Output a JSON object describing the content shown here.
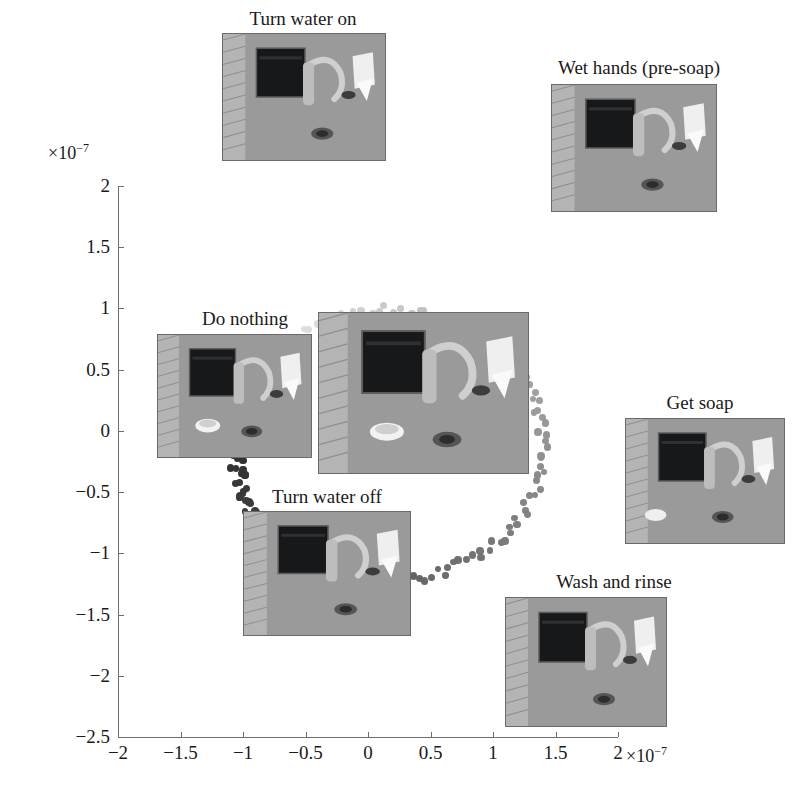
{
  "figure": {
    "type": "scatter-embedding",
    "background": "#ffffff"
  },
  "axes": {
    "x": {
      "label": "",
      "exponent_prefix": "×",
      "exponent_base": "10",
      "exponent_power": "−7",
      "ticks": [
        "−2",
        "−1.5",
        "−1",
        "−0.5",
        "0",
        "0.5",
        "1",
        "1.5",
        "2"
      ],
      "tick_values": [
        -2,
        -1.5,
        -1,
        -0.5,
        0,
        0.5,
        1,
        1.5,
        2
      ],
      "range": [
        -2,
        2
      ],
      "scale_factor": "1e-7"
    },
    "y": {
      "label": "",
      "exponent_prefix": "×",
      "exponent_base": "10",
      "exponent_power": "−7",
      "ticks": [
        "2",
        "1.5",
        "1",
        "0.5",
        "0",
        "−0.5",
        "−1",
        "−1.5",
        "−2",
        "−2.5"
      ],
      "tick_values": [
        2,
        1.5,
        1,
        0.5,
        0,
        -0.5,
        -1,
        -1.5,
        -2,
        -2.5
      ],
      "range": [
        -2.5,
        2
      ],
      "scale_factor": "1e-7"
    },
    "grid": false,
    "axis_color": "#6e6e6e"
  },
  "keyframes": [
    {
      "id": "turn-water-on",
      "caption": "Turn water on",
      "caption_x": 303,
      "caption_y": 8,
      "thumb": {
        "x": 222,
        "y": 33,
        "w": 164,
        "h": 128
      },
      "image_kind": "sink-hands-faucet"
    },
    {
      "id": "wet-hands-pre-soap",
      "caption": "Wet  hands (pre-soap)",
      "caption_x": 639,
      "caption_y": 57,
      "thumb": {
        "x": 551,
        "y": 84,
        "w": 166,
        "h": 128
      },
      "image_kind": "sink-hands-faucet"
    },
    {
      "id": "do-nothing",
      "caption": "Do nothing",
      "caption_x": 245,
      "caption_y": 308,
      "thumb": {
        "x": 157,
        "y": 334,
        "w": 155,
        "h": 124
      },
      "image_kind": "sink-empty"
    },
    {
      "id": "center-reference",
      "caption": "",
      "caption_x": 0,
      "caption_y": 0,
      "thumb": {
        "x": 318,
        "y": 312,
        "w": 211,
        "h": 162
      },
      "image_kind": "sink-empty-large"
    },
    {
      "id": "get-soap",
      "caption": "Get soap",
      "caption_x": 700,
      "caption_y": 392,
      "thumb": {
        "x": 625,
        "y": 418,
        "w": 160,
        "h": 126
      },
      "image_kind": "sink-hands-soap"
    },
    {
      "id": "turn-water-off",
      "caption": "Turn water off",
      "caption_x": 327,
      "caption_y": 486,
      "thumb": {
        "x": 243,
        "y": 511,
        "w": 168,
        "h": 125
      },
      "image_kind": "sink-hands-faucet"
    },
    {
      "id": "wash-and-rinse",
      "caption": "Wash and rinse",
      "caption_x": 614,
      "caption_y": 571,
      "thumb": {
        "x": 505,
        "y": 597,
        "w": 162,
        "h": 130
      },
      "image_kind": "sink-hands-wash"
    }
  ],
  "chart_data": {
    "type": "scatter",
    "title": "",
    "xlabel": "",
    "ylabel": "",
    "xlim": [
      -2,
      2
    ],
    "ylim": [
      -2.5,
      2
    ],
    "grid": false,
    "legend": "none",
    "scale_factor": "1e-7",
    "marker": {
      "shape": "circle",
      "size_px": 7,
      "colormap": "grayscale-temporal",
      "color_start": "#ededed",
      "color_end": "#1c1c1c"
    },
    "ring": {
      "center_x": 0.17,
      "center_y": -0.12,
      "radius_x": 1.23,
      "radius_y": 1.1,
      "n_points": 148
    },
    "points": [
      {
        "x": -0.62,
        "y": 1.02,
        "t": 0.0
      },
      {
        "x": -0.53,
        "y": 1.14,
        "t": 0.01
      },
      {
        "x": -0.44,
        "y": 1.24,
        "t": 0.02
      },
      {
        "x": -0.33,
        "y": 1.33,
        "t": 0.03
      },
      {
        "x": -0.22,
        "y": 1.41,
        "t": 0.04
      },
      {
        "x": -0.11,
        "y": 1.48,
        "t": 0.05
      },
      {
        "x": 0.01,
        "y": 1.55,
        "t": 0.06
      },
      {
        "x": 0.13,
        "y": 1.61,
        "t": 0.07
      },
      {
        "x": 0.26,
        "y": 1.68,
        "t": 0.08
      },
      {
        "x": 0.38,
        "y": 1.74,
        "t": 0.09
      },
      {
        "x": 0.51,
        "y": 1.79,
        "t": 0.1
      },
      {
        "x": 0.63,
        "y": 1.82,
        "t": 0.12
      },
      {
        "x": 0.76,
        "y": 1.84,
        "t": 0.14
      },
      {
        "x": 0.88,
        "y": 1.83,
        "t": 0.16
      },
      {
        "x": 1.0,
        "y": 1.79,
        "t": 0.18
      },
      {
        "x": 1.11,
        "y": 1.73,
        "t": 0.2
      },
      {
        "x": 1.21,
        "y": 1.65,
        "t": 0.22
      },
      {
        "x": 1.3,
        "y": 1.55,
        "t": 0.24
      },
      {
        "x": 1.38,
        "y": 1.43,
        "t": 0.26
      },
      {
        "x": 1.45,
        "y": 1.29,
        "t": 0.28
      },
      {
        "x": 1.51,
        "y": 1.13,
        "t": 0.3
      },
      {
        "x": 1.56,
        "y": 0.96,
        "t": 0.33
      },
      {
        "x": 1.59,
        "y": 0.78,
        "t": 0.36
      },
      {
        "x": 1.6,
        "y": 0.59,
        "t": 0.39
      },
      {
        "x": 1.6,
        "y": 0.4,
        "t": 0.42
      },
      {
        "x": 1.58,
        "y": 0.2,
        "t": 0.45
      },
      {
        "x": 1.55,
        "y": 0.01,
        "t": 0.48
      },
      {
        "x": 1.5,
        "y": -0.18,
        "t": 0.51
      },
      {
        "x": 1.44,
        "y": -0.37,
        "t": 0.54
      },
      {
        "x": 1.36,
        "y": -0.55,
        "t": 0.57
      },
      {
        "x": 1.27,
        "y": -0.72,
        "t": 0.6
      },
      {
        "x": 1.16,
        "y": -0.89,
        "t": 0.63
      },
      {
        "x": 1.04,
        "y": -1.05,
        "t": 0.66
      },
      {
        "x": 0.91,
        "y": -1.2,
        "t": 0.69
      },
      {
        "x": 0.77,
        "y": -1.34,
        "t": 0.72
      },
      {
        "x": 0.62,
        "y": -1.47,
        "t": 0.75
      },
      {
        "x": 0.46,
        "y": -1.59,
        "t": 0.78
      },
      {
        "x": 0.29,
        "y": -1.7,
        "t": 0.81
      },
      {
        "x": 0.12,
        "y": -1.79,
        "t": 0.84
      },
      {
        "x": -0.06,
        "y": -1.88,
        "t": 0.86
      },
      {
        "x": -0.24,
        "y": -1.95,
        "t": 0.88
      },
      {
        "x": -0.42,
        "y": -2.0,
        "t": 0.9
      },
      {
        "x": -0.6,
        "y": -2.03,
        "t": 0.92
      },
      {
        "x": -0.77,
        "y": -2.02,
        "t": 0.94
      },
      {
        "x": -0.92,
        "y": -1.96,
        "t": 0.96
      },
      {
        "x": -1.03,
        "y": -1.84,
        "t": 0.98
      },
      {
        "x": -1.09,
        "y": -1.68,
        "t": 1.0
      }
    ]
  }
}
